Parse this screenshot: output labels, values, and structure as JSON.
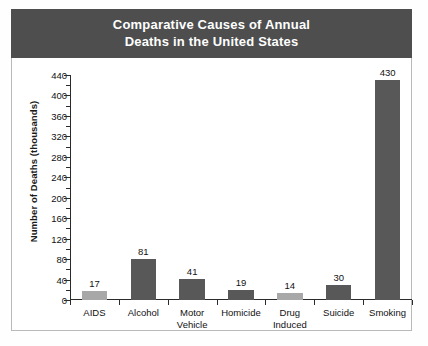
{
  "title": {
    "line1": "Comparative Causes of Annual",
    "line2": "Deaths in the United States"
  },
  "colors": {
    "banner_background": "#4e4e4e",
    "banner_text": "#ffffff",
    "bar_dark": "#585858",
    "bar_light": "#a8a8a8",
    "axis": "#2b2b2b",
    "frame_border": "#b9b9b9",
    "plot_background": "#ffffff"
  },
  "chart_data": {
    "type": "bar",
    "title": "Comparative Causes of Annual Deaths in the United States",
    "xlabel": "",
    "ylabel": "Number of Deaths (thousands)",
    "ylim": [
      0,
      440
    ],
    "ytick_step": 40,
    "yminor_step": 20,
    "grid": false,
    "legend": "none",
    "categories": [
      "AIDS",
      "Motor Vehicle",
      "Alcohol",
      "Homicide",
      "Drug Induced",
      "Suicide",
      "Smoking"
    ],
    "category_labels": [
      [
        "AIDS"
      ],
      [
        "Alcohol"
      ],
      [
        "Motor",
        "Vehicle"
      ],
      [
        "Homicide"
      ],
      [
        "Drug",
        "Induced"
      ],
      [
        "Suicide"
      ],
      [
        "Smoking"
      ]
    ],
    "values": [
      17,
      81,
      41,
      19,
      14,
      30,
      430
    ],
    "bar_shades": [
      "light",
      "dark",
      "dark",
      "dark",
      "light",
      "dark",
      "dark"
    ],
    "ytick_labels": [
      "440",
      "400",
      "360",
      "320",
      "280",
      "240",
      "200",
      "160",
      "120",
      "80",
      "40",
      "0"
    ],
    "ytick_values": [
      440,
      400,
      360,
      320,
      280,
      240,
      200,
      160,
      120,
      80,
      40,
      0
    ]
  }
}
